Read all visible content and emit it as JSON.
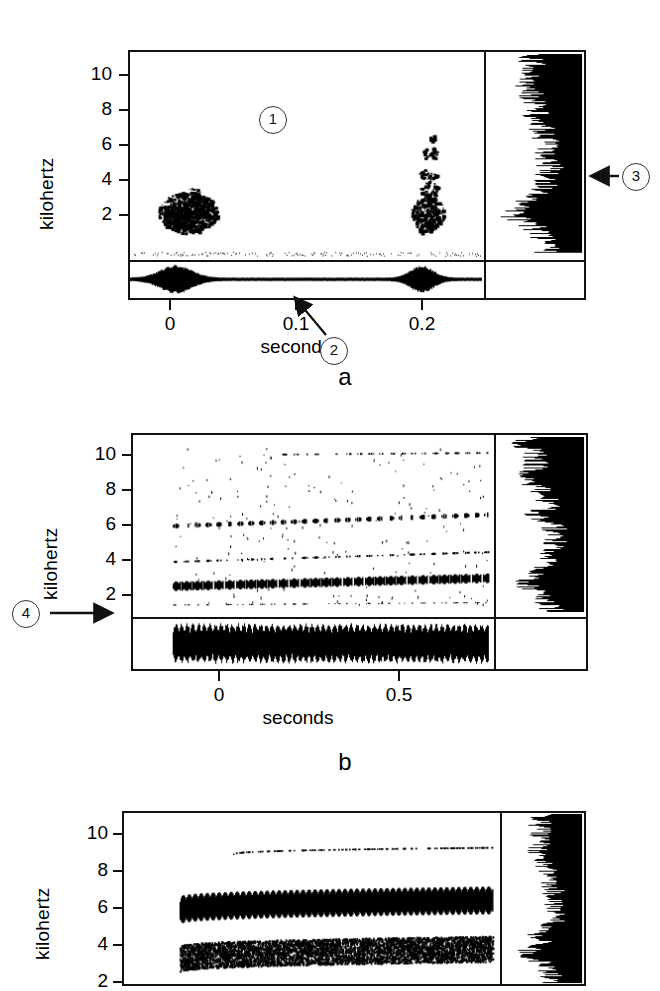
{
  "figure": {
    "type": "scientific-figure-spectrograms",
    "panel_count": 3,
    "ink_color": "#000000",
    "background": "#ffffff"
  },
  "panels": [
    {
      "letter": "a",
      "ylabel": "kilohertz",
      "xlabel": "seconds",
      "ytick_labels": [
        "10",
        "8",
        "6",
        "4",
        "2"
      ],
      "ytick_values": [
        10,
        8,
        6,
        4,
        2
      ],
      "xtick_labels": [
        "0",
        "0.1",
        "0.2"
      ],
      "xtick_values": [
        0,
        0.1,
        0.2
      ],
      "ylim": [
        0,
        11
      ],
      "xlim": [
        -0.03,
        0.247
      ],
      "has_power_spectrum_sidebar": true,
      "has_oscillogram_strip": true
    },
    {
      "letter": "b",
      "ylabel": "kilohertz",
      "xlabel": "seconds",
      "ytick_labels": [
        "10",
        "8",
        "6",
        "4",
        "2"
      ],
      "ytick_values": [
        10,
        8,
        6,
        4,
        2
      ],
      "xtick_labels": [
        "0",
        "0.5"
      ],
      "xtick_values": [
        0,
        0.5
      ],
      "ylim": [
        0,
        11
      ],
      "xlim": [
        -0.245,
        1.02
      ],
      "has_power_spectrum_sidebar": true,
      "has_oscillogram_strip": true
    },
    {
      "letter": "c",
      "ylabel": "kilohertz",
      "xlabel": "",
      "ytick_labels": [
        "10",
        "8",
        "6",
        "4",
        "2"
      ],
      "ytick_values": [
        10,
        8,
        6,
        4,
        2
      ],
      "xtick_labels": [],
      "xtick_values": [],
      "ylim": [
        0,
        11
      ],
      "xlim": [
        0,
        1
      ],
      "has_power_spectrum_sidebar": true,
      "has_oscillogram_strip": false,
      "note_cropped_at_bottom": true
    }
  ],
  "callouts": [
    {
      "id": "1",
      "label": "1",
      "panel": "a",
      "has_arrow": false,
      "arrow_direction": "none"
    },
    {
      "id": "2",
      "label": "2",
      "panel": "a",
      "has_arrow": true,
      "arrow_direction": "up-left"
    },
    {
      "id": "3",
      "label": "3",
      "panel": "a",
      "has_arrow": true,
      "arrow_direction": "left"
    },
    {
      "id": "4",
      "label": "4",
      "panel": "b",
      "has_arrow": true,
      "arrow_direction": "right"
    }
  ],
  "chart_data": [
    {
      "type": "heatmap",
      "subtype": "spectrogram",
      "panel": "a",
      "title": "",
      "xlabel": "seconds",
      "ylabel": "kilohertz",
      "xlim": [
        -0.03,
        0.247
      ],
      "ylim": [
        0,
        11
      ],
      "xticks": [
        0,
        0.1,
        0.2
      ],
      "xtick_labels": [
        "0",
        "0.1",
        "0.2"
      ],
      "yticks": [
        2,
        4,
        6,
        8,
        10
      ],
      "ytick_labels": [
        "2",
        "4",
        "6",
        "8",
        "10"
      ],
      "grid": false,
      "legend": "none",
      "energy_blobs": [
        {
          "t_start": 0.0,
          "t_end": 0.042,
          "f_low": 1.3,
          "f_high": 3.6,
          "density": 0.95,
          "note": "first broadband click burst"
        },
        {
          "t_start": 0.185,
          "t_end": 0.212,
          "f_low": 1.4,
          "f_high": 6.7,
          "density": 0.8,
          "note": "second click burst, extends higher in frequency"
        }
      ],
      "sidebar_spectrum": {
        "type": "line",
        "orientation": "vertical",
        "ylabel": "kilohertz",
        "ylim": [
          0,
          11
        ],
        "peak_frequency_khz": 2.2,
        "description": "average power spectrum, amplitude increasing to the right, filled black"
      },
      "oscillogram": {
        "type": "line",
        "description": "waveform strip beneath spectrogram, two amplitude bursts aligned with the energy blobs",
        "burst_times": [
          0.02,
          0.2
        ]
      }
    },
    {
      "type": "heatmap",
      "subtype": "spectrogram",
      "panel": "b",
      "title": "",
      "xlabel": "seconds",
      "ylabel": "kilohertz",
      "xlim": [
        -0.245,
        1.02
      ],
      "ylim": [
        0,
        11
      ],
      "xticks": [
        0,
        0.5
      ],
      "xtick_labels": [
        "0",
        "0.5"
      ],
      "yticks": [
        2,
        4,
        6,
        8,
        10
      ],
      "ytick_labels": [
        "2",
        "4",
        "6",
        "8",
        "10"
      ],
      "grid": false,
      "legend": "none",
      "harmonic_bands": [
        {
          "band": 1,
          "f_start": 1.7,
          "f_end": 2.2,
          "t_start": -0.2,
          "t_end": 0.95,
          "density": 1.0,
          "note": "fundamental, strongest"
        },
        {
          "band": 2,
          "f_start": 3.2,
          "f_end": 3.8,
          "t_start": -0.2,
          "t_end": 0.95,
          "density": 0.55
        },
        {
          "band": 3,
          "f_start": 5.4,
          "f_end": 6.1,
          "t_start": -0.18,
          "t_end": 0.95,
          "density": 0.75
        },
        {
          "band": 4,
          "f_start": 9.8,
          "f_end": 9.9,
          "t_start": 0.14,
          "t_end": 0.95,
          "density": 0.45,
          "note": "appears part-way through"
        },
        {
          "band": 5,
          "f_start": 0.55,
          "f_end": 0.7,
          "t_start": -0.2,
          "t_end": 0.95,
          "density": 0.4,
          "note": "low band just above baseline"
        }
      ],
      "pulse_rate_note": "regular vertical striations indicating pulsed amplitude modulation",
      "sidebar_spectrum": {
        "type": "line",
        "orientation": "vertical",
        "ylim": [
          0,
          11
        ],
        "peak_frequency_khz": 2.0,
        "secondary_peaks_khz": [
          6.0,
          8.3,
          10.5
        ],
        "description": "average power spectrum, filled black"
      },
      "oscillogram": {
        "type": "line",
        "description": "continuous pulsed waveform spanning the whole record"
      }
    },
    {
      "type": "heatmap",
      "subtype": "spectrogram",
      "panel": "c",
      "title": "",
      "xlabel": "",
      "ylabel": "kilohertz",
      "xlim": [
        0,
        1
      ],
      "ylim": [
        0,
        11
      ],
      "xticks": [],
      "xtick_labels": [],
      "yticks": [
        2,
        4,
        6,
        8,
        10
      ],
      "ytick_labels": [
        "2",
        "4",
        "6",
        "8",
        "10"
      ],
      "grid": false,
      "legend": "none",
      "harmonic_bands": [
        {
          "band": 1,
          "f_start": 2.9,
          "f_end": 4.2,
          "t_start": 0.1,
          "t_end": 0.97,
          "density": 1.0,
          "note": "dense broad band rising slightly"
        },
        {
          "band": 2,
          "f_start": 4.4,
          "f_end": 4.9,
          "t_start": 0.22,
          "t_end": 0.97,
          "density": 0.45,
          "note": "faint upper band"
        }
      ],
      "sidebar_spectrum": {
        "type": "line",
        "orientation": "vertical",
        "ylim": [
          0,
          11
        ],
        "peak_frequency_khz": 3.6,
        "description": "average power spectrum, filled black"
      },
      "cropped": true
    }
  ]
}
